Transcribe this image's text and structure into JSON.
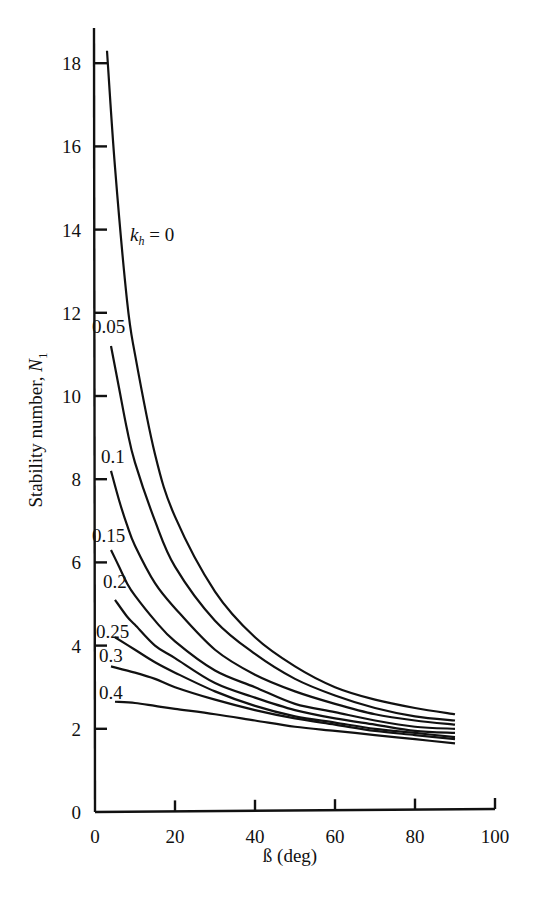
{
  "chart_data": {
    "type": "line",
    "title": "",
    "xlabel": "ß (deg)",
    "ylabel": "Stability number, N1",
    "xlim": [
      0,
      100
    ],
    "ylim": [
      0,
      19
    ],
    "grid": false,
    "legend": "inline curve labels",
    "x_ticks": [
      0,
      20,
      40,
      60,
      80,
      100
    ],
    "y_ticks": [
      0,
      2,
      4,
      6,
      8,
      10,
      12,
      14,
      16,
      18
    ],
    "series": [
      {
        "name": "k_h = 0",
        "label": "k_h = 0",
        "x": [
          3,
          5,
          8,
          10,
          15,
          20,
          30,
          40,
          50,
          60,
          70,
          80,
          90
        ],
        "y": [
          18.3,
          15.5,
          12.3,
          11.0,
          8.6,
          7.1,
          5.3,
          4.2,
          3.5,
          3.0,
          2.7,
          2.5,
          2.35
        ]
      },
      {
        "name": "k_h = 0.05",
        "label": "0.05",
        "x": [
          4,
          6,
          8,
          10,
          15,
          20,
          30,
          40,
          50,
          60,
          70,
          80,
          90
        ],
        "y": [
          11.2,
          10.2,
          9.2,
          8.4,
          7.0,
          5.9,
          4.6,
          3.8,
          3.2,
          2.8,
          2.5,
          2.3,
          2.2
        ]
      },
      {
        "name": "k_h = 0.1",
        "label": "0.1",
        "x": [
          4,
          6,
          8,
          10,
          15,
          20,
          30,
          40,
          50,
          60,
          70,
          80,
          90
        ],
        "y": [
          8.2,
          7.5,
          6.9,
          6.4,
          5.5,
          4.9,
          3.9,
          3.3,
          2.9,
          2.6,
          2.35,
          2.2,
          2.1
        ]
      },
      {
        "name": "k_h = 0.15",
        "label": "0.15",
        "x": [
          4,
          6,
          8,
          10,
          15,
          20,
          30,
          40,
          50,
          60,
          70,
          80,
          90
        ],
        "y": [
          6.3,
          5.9,
          5.5,
          5.2,
          4.6,
          4.1,
          3.4,
          3.0,
          2.6,
          2.4,
          2.2,
          2.05,
          2.0
        ]
      },
      {
        "name": "k_h = 0.2",
        "label": "0.2",
        "x": [
          5,
          8,
          10,
          15,
          20,
          30,
          40,
          50,
          60,
          70,
          80,
          90
        ],
        "y": [
          5.1,
          4.7,
          4.5,
          4.0,
          3.7,
          3.1,
          2.75,
          2.45,
          2.25,
          2.1,
          1.95,
          1.9
        ]
      },
      {
        "name": "k_h = 0.25",
        "label": "0.25",
        "x": [
          5,
          10,
          15,
          20,
          30,
          40,
          50,
          60,
          70,
          80,
          90
        ],
        "y": [
          4.2,
          3.9,
          3.6,
          3.35,
          2.9,
          2.55,
          2.3,
          2.15,
          2.0,
          1.9,
          1.8
        ]
      },
      {
        "name": "k_h = 0.3",
        "label": "0.3",
        "x": [
          4,
          10,
          15,
          20,
          30,
          40,
          50,
          60,
          70,
          80,
          90
        ],
        "y": [
          3.5,
          3.35,
          3.2,
          3.0,
          2.7,
          2.45,
          2.25,
          2.1,
          1.95,
          1.85,
          1.75
        ]
      },
      {
        "name": "k_h = 0.4",
        "label": "0.4",
        "x": [
          5,
          10,
          15,
          20,
          30,
          40,
          50,
          60,
          70,
          80,
          90
        ],
        "y": [
          2.65,
          2.62,
          2.55,
          2.48,
          2.35,
          2.2,
          2.05,
          1.95,
          1.85,
          1.75,
          1.65
        ]
      }
    ]
  },
  "labels": {
    "xlabel": "ß (deg)",
    "ylabel_main": "Stability number, ",
    "ylabel_sym": "N",
    "ylabel_sub": "1",
    "kh_k": "k",
    "kh_sub": "h",
    "kh_eq": " = 0"
  }
}
